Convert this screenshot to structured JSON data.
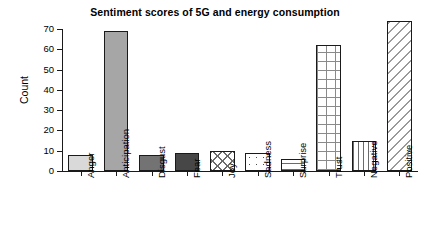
{
  "chart_data": {
    "type": "bar",
    "title": "Sentiment scores of 5G and energy consumption",
    "xlabel": "",
    "ylabel": "Count",
    "categories": [
      "Anger",
      "Anticipation",
      "Disgust",
      "Fear",
      "Joy",
      "Sadness",
      "Surprise",
      "Trust",
      "Negative",
      "Positive"
    ],
    "values": [
      8,
      69,
      8,
      9,
      10,
      9,
      6,
      62,
      15,
      74
    ],
    "ylim": [
      0,
      70
    ],
    "ytick_labels": [
      "0",
      "10",
      "20",
      "30",
      "40",
      "50",
      "60",
      "70"
    ],
    "ytick_values": [
      0,
      10,
      20,
      30,
      40,
      50,
      60,
      70
    ],
    "grid": false,
    "legend": "none",
    "bar_fills": [
      "light-gray-solid",
      "medium-gray-solid",
      "dark-gray-solid",
      "charcoal-solid",
      "crosshatch-x",
      "dotted",
      "horizontal-lines",
      "grid-mesh",
      "vertical-lines",
      "diagonal-hatch"
    ],
    "bar_border_color": "#1a1a1a",
    "axis_color": "#1a1a1a",
    "background_color": "#ffffff"
  }
}
